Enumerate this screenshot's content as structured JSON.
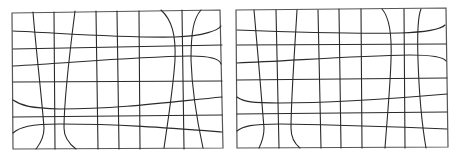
{
  "diagram": {
    "stroke_color": "#2a2a2a",
    "border_color": "#555555",
    "background": "#ffffff",
    "panels": [
      {
        "name": "left-distorted-grid",
        "border": "M12,13 L220,10 L223,148 L13,149 Z",
        "lines": [
          "M33,12 C36,50 42,100 44,128 C44,140 38,146 36,149",
          "M54,12 L55,149",
          "M75,11 C70,50 64,100 64,128 C64,140 72,146 76,149",
          "M96,11 L98,149",
          "M117,11 L119,149",
          "M139,11 L140,149",
          "M161,10 C172,20 176,35 175,60 C173,90 168,120 164,148",
          "M182,10 L184,149",
          "M201,10 C194,18 191,30 191,60 C192,90 198,125 203,148",
          "M13,31 C60,33 120,38 175,37 C205,36 218,30 221,26",
          "M13,49 L222,45",
          "M13,66 C70,63 130,57 190,56 C212,56 220,60 221,64",
          "M13,82 L222,81",
          "M13,100 C22,106 30,108 60,109 C120,109 170,102 222,97",
          "M13,117 L222,115",
          "M13,133 C20,127 30,124 60,124 C120,124 170,128 222,132"
        ]
      },
      {
        "name": "right-distorted-grid",
        "border": "M236,10 L446,8 L448,147 L237,148 Z",
        "lines": [
          "M254,10 C257,45 262,100 264,128 C264,138 261,144 259,148",
          "M276,10 L279,148",
          "M297,10 C295,45 291,100 291,128 C291,138 295,144 300,148",
          "M318,10 L321,148",
          "M339,9 L341,148",
          "M361,9 L362,148",
          "M382,9 C390,18 392,35 391,60 C390,90 387,120 385,148",
          "M404,9 L405,148",
          "M421,9 C418,16 417,30 418,60 C419,90 422,125 426,148",
          "M237,30 C290,32 350,34 400,33 C430,32 442,28 445,25",
          "M237,45 L446,44",
          "M237,63 C290,61 350,56 410,55 C435,55 444,58 446,61",
          "M237,80 L447,78",
          "M237,97 C244,102 252,103 280,103 C340,103 400,98 447,94",
          "M237,114 L447,112",
          "M237,131 C243,126 252,124 280,124 C340,125 400,127 447,129"
        ]
      }
    ]
  }
}
